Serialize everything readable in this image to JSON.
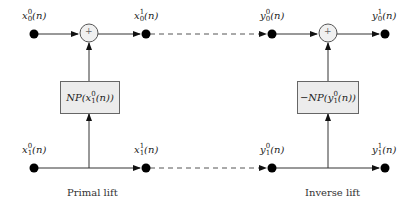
{
  "diagram": {
    "type": "lifting-scheme",
    "colors": {
      "line": "#333333",
      "node": "#000000",
      "box_fill": "#ececec",
      "adder_fill": "#f0f0f0"
    },
    "primal": {
      "caption": "Primal lift",
      "nodes": {
        "top_in": {
          "base": "x",
          "sub": "0",
          "sup": "0",
          "arg": "(n)"
        },
        "top_out": {
          "base": "x",
          "sub": "0",
          "sup": "1",
          "arg": "(n)"
        },
        "bot_in": {
          "base": "x",
          "sub": "1",
          "sup": "0",
          "arg": "(n)"
        },
        "bot_out": {
          "base": "x",
          "sub": "1",
          "sup": "1",
          "arg": "(n)"
        }
      },
      "box": {
        "prefix": "NP(",
        "base": "x",
        "sub": "1",
        "sup": "0",
        "suffix": "(n))"
      },
      "adder": "+"
    },
    "inverse": {
      "caption": "Inverse lift",
      "nodes": {
        "top_in": {
          "base": "y",
          "sub": "0",
          "sup": "0",
          "arg": "(n)"
        },
        "top_out": {
          "base": "y",
          "sub": "0",
          "sup": "1",
          "arg": "(n)"
        },
        "bot_in": {
          "base": "y",
          "sub": "1",
          "sup": "0",
          "arg": "(n)"
        },
        "bot_out": {
          "base": "y",
          "sub": "1",
          "sup": "1",
          "arg": "(n)"
        }
      },
      "box": {
        "prefix": "−NP(",
        "base": "y",
        "sub": "1",
        "sup": "0",
        "suffix": "(n))"
      },
      "adder": "+"
    }
  }
}
